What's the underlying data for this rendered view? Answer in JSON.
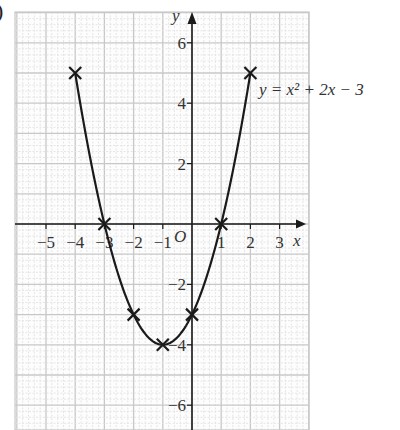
{
  "part_marker": ")",
  "chart_data": {
    "type": "line",
    "title": "",
    "equation_label": "y = x² + 2x − 3",
    "xlabel": "x",
    "ylabel": "y",
    "origin_label": "O",
    "x_ticks": [
      -5,
      -4,
      -3,
      -2,
      -1,
      1,
      2,
      3
    ],
    "x_tick_labels": [
      "−5",
      "−4",
      "−3",
      "−2",
      "−1",
      "1",
      "2",
      "3"
    ],
    "y_ticks": [
      6,
      4,
      2,
      -2,
      -4,
      -6
    ],
    "y_tick_labels": [
      "6",
      "4",
      "2",
      "−2",
      "−4",
      "−6"
    ],
    "xlim": [
      -6,
      4
    ],
    "ylim": [
      -7,
      7
    ],
    "grid": true,
    "series": [
      {
        "name": "y = x² + 2x − 3",
        "marker": "x",
        "x": [
          -4,
          -3,
          -2,
          -1,
          0,
          1,
          2
        ],
        "values": [
          5,
          0,
          -3,
          -4,
          -3,
          0,
          5
        ]
      }
    ],
    "colors": {
      "curve": "#1a1a1a",
      "axis": "#1a1a1a",
      "grid_major": "#c8c8c8",
      "grid_minor": "#e2e2e2"
    }
  }
}
